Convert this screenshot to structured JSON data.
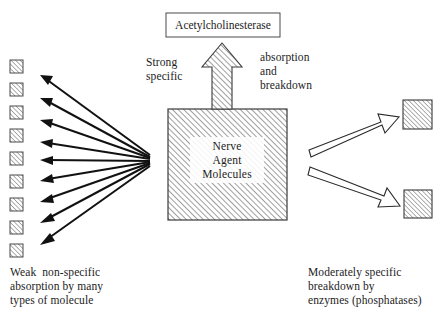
{
  "diagram": {
    "title_box": {
      "label": "Acetylcholinesterase"
    },
    "center_box": {
      "label": "Nerve\nAgent\nMolecules"
    },
    "mid_labels": {
      "left": "Strong\nspecific",
      "right": "absorption\nand\nbreakdown"
    },
    "captions": {
      "left": "Weak  non-specific\nabsorption by many\ntypes of molecule",
      "right": "Moderately specific\nbreakdown by\nenzymes (phosphatases)"
    },
    "colors": {
      "stroke": "#1a1a1a",
      "hatch": "#6b6b6b",
      "background": "#ffffff",
      "arrow_fill": "#ffffff"
    },
    "counts": {
      "left_squares": 9,
      "left_arrows": 9,
      "right_squares": 2,
      "right_arrows": 2,
      "up_arrows": 1
    },
    "left_squares": [
      {
        "x": 10,
        "y": 60,
        "w": 13,
        "h": 13
      },
      {
        "x": 10,
        "y": 83,
        "w": 13,
        "h": 13
      },
      {
        "x": 10,
        "y": 106,
        "w": 13,
        "h": 13
      },
      {
        "x": 10,
        "y": 129,
        "w": 13,
        "h": 13
      },
      {
        "x": 10,
        "y": 152,
        "w": 13,
        "h": 13
      },
      {
        "x": 10,
        "y": 175,
        "w": 13,
        "h": 13
      },
      {
        "x": 10,
        "y": 198,
        "w": 13,
        "h": 13
      },
      {
        "x": 10,
        "y": 221,
        "w": 13,
        "h": 13
      },
      {
        "x": 10,
        "y": 244,
        "w": 13,
        "h": 13
      }
    ],
    "left_arrows": [
      {
        "x1": 150,
        "y1": 155,
        "x2": 42,
        "y2": 76
      },
      {
        "x1": 150,
        "y1": 157,
        "x2": 42,
        "y2": 99
      },
      {
        "x1": 150,
        "y1": 158,
        "x2": 42,
        "y2": 120
      },
      {
        "x1": 150,
        "y1": 159,
        "x2": 42,
        "y2": 142
      },
      {
        "x1": 150,
        "y1": 161,
        "x2": 42,
        "y2": 160
      },
      {
        "x1": 150,
        "y1": 162,
        "x2": 42,
        "y2": 180
      },
      {
        "x1": 150,
        "y1": 163,
        "x2": 42,
        "y2": 200
      },
      {
        "x1": 150,
        "y1": 164,
        "x2": 42,
        "y2": 221
      },
      {
        "x1": 150,
        "y1": 166,
        "x2": 42,
        "y2": 243
      }
    ],
    "right_squares": [
      {
        "x": 403,
        "y": 100,
        "w": 29,
        "h": 29
      },
      {
        "x": 404,
        "y": 190,
        "w": 28,
        "h": 28
      }
    ],
    "right_arrows": [
      {
        "x1": 309,
        "y1": 152,
        "x2": 396,
        "y2": 118
      },
      {
        "x1": 309,
        "y1": 168,
        "x2": 398,
        "y2": 204
      }
    ],
    "center_box_rect": {
      "x": 168,
      "y": 109,
      "w": 119,
      "h": 111
    },
    "title_box_rect": {
      "x": 166,
      "y": 13,
      "w": 114,
      "h": 24
    },
    "up_arrow": {
      "x": 202,
      "y": 43,
      "w": 40,
      "h": 66
    }
  }
}
